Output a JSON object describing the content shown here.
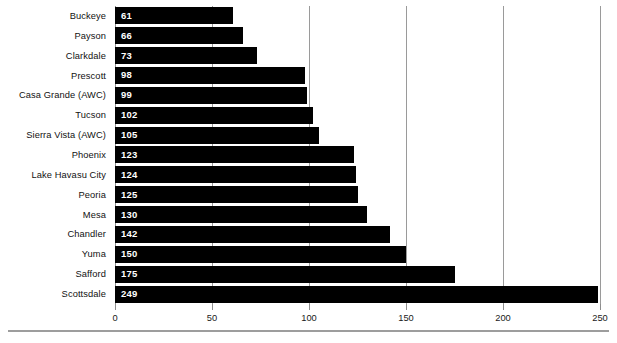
{
  "chart_data": {
    "type": "bar",
    "orientation": "horizontal",
    "title": "",
    "subtitle": "",
    "xlabel": "",
    "ylabel": "",
    "grid": true,
    "legend": null,
    "xlim": [
      0,
      250
    ],
    "xticks": [
      0,
      50,
      100,
      150,
      200,
      250
    ],
    "xtick_labels": [
      "0",
      "50",
      "100",
      "150",
      "200",
      "250"
    ],
    "bar_color": "#000000",
    "value_label_color": "#ffffff",
    "gridline_color": "#9a9a9a",
    "categories": [
      "Buckeye",
      "Payson",
      "Clarkdale",
      "Prescott",
      "Casa Grande (AWC)",
      "Tucson",
      "Sierra Vista (AWC)",
      "Phoenix",
      "Lake Havasu City",
      "Peoria",
      "Mesa",
      "Chandler",
      "Yuma",
      "Safford",
      "Scottsdale"
    ],
    "values": [
      61,
      66,
      73,
      98,
      99,
      102,
      105,
      123,
      124,
      125,
      130,
      142,
      150,
      175,
      249
    ],
    "value_labels": [
      "61",
      "66",
      "73",
      "98",
      "99",
      "102",
      "105",
      "123",
      "124",
      "125",
      "130",
      "142",
      "150",
      "175",
      "249"
    ]
  }
}
